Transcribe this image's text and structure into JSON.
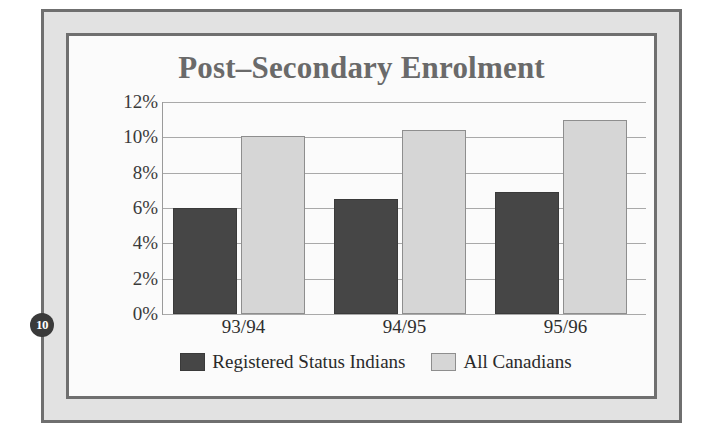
{
  "slide": {
    "page_number": "10",
    "title": "Post–Secondary Enrolment"
  },
  "colors": {
    "frame_border": "#6f6f6f",
    "frame_fill": "#e2e2e2",
    "slide_background": "#fbfbfb",
    "title_text": "#6a6a6a",
    "series_dark": "#464646",
    "series_light": "#d6d6d6",
    "gridline": "#a9a9a9",
    "axis_line": "#9a9a9a",
    "badge_background": "#3a3a3a",
    "badge_text": "#ffffff"
  },
  "chart_data": {
    "type": "bar",
    "title": "Post–Secondary Enrolment",
    "xlabel": "",
    "ylabel": "",
    "categories": [
      "93/94",
      "94/95",
      "95/96"
    ],
    "series": [
      {
        "name": "Registered Status Indians",
        "color": "#464646",
        "values": [
          6.0,
          6.5,
          6.9
        ]
      },
      {
        "name": "All Canadians",
        "color": "#d6d6d6",
        "values": [
          10.1,
          10.4,
          11.0
        ]
      }
    ],
    "ylim": [
      0,
      12
    ],
    "ytick_values": [
      0,
      2,
      4,
      6,
      8,
      10,
      12
    ],
    "ytick_labels": [
      "0%",
      "2%",
      "4%",
      "6%",
      "8%",
      "10%",
      "12%"
    ],
    "grid": true,
    "grid_axis": "y",
    "legend_position": "bottom",
    "value_suffix": "%"
  }
}
